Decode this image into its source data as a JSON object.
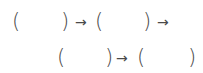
{
  "sequence": {
    "row1": {
      "open1": "(",
      "close1": ")",
      "arrow1": "→",
      "open2": "(",
      "close2": ")",
      "arrow2": "→"
    },
    "row2": {
      "open1": "(",
      "close1": ")",
      "arrow1": "→",
      "open2": "(",
      "close2": ")"
    }
  }
}
